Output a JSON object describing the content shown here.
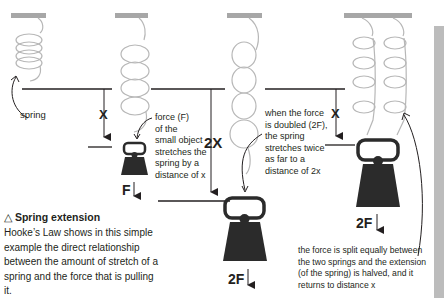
{
  "colors": {
    "spring": "#b7b7b7",
    "ceiling": "#a7a7a7",
    "lines": "#231f20",
    "weight": "#2b2b2b",
    "sidebar": "#bcbcbc"
  },
  "labels": {
    "spring": "spring",
    "x1": "X",
    "force_desc": [
      "force (F)",
      "of the",
      "small object",
      "stretches the",
      "spring by a",
      "distance of x"
    ],
    "f1": "F",
    "x2": "2X",
    "doubled_desc": [
      "when the force",
      "is doubled (2F),",
      "the spring",
      "stretches twice",
      "as far to a",
      "distance of 2x"
    ],
    "f2": "2F",
    "x3": "X",
    "f3": "2F",
    "split_desc": [
      "the force is split equally between",
      "the two springs and the extension",
      "(of the spring) is halved, and it",
      "returns to distance x"
    ]
  },
  "caption": {
    "icon": "△",
    "title": "Spring extension",
    "body": "Hooke’s Law shows in this simple example the direct relationship between the amount of stretch of a spring and the force that is pulling it."
  }
}
